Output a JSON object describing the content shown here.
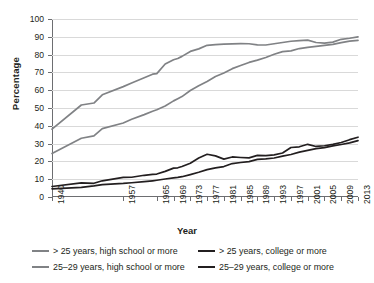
{
  "chart_data": {
    "type": "line",
    "title": "",
    "xlabel": "Year",
    "ylabel": "Percentage",
    "ylim": [
      0,
      100
    ],
    "xlim": [
      1940,
      2013
    ],
    "grid": true,
    "legend_position": "bottom",
    "yticks": [
      0,
      10,
      20,
      30,
      40,
      50,
      60,
      70,
      80,
      90,
      100
    ],
    "xticks": [
      1940,
      1957,
      1965,
      1969,
      1973,
      1977,
      1981,
      1985,
      1989,
      1993,
      1997,
      2001,
      2005,
      2009,
      2013
    ],
    "x": [
      1940,
      1947,
      1950,
      1952,
      1957,
      1959,
      1962,
      1964,
      1965,
      1967,
      1969,
      1970,
      1971,
      1973,
      1975,
      1977,
      1979,
      1981,
      1983,
      1985,
      1987,
      1989,
      1991,
      1993,
      1995,
      1997,
      1999,
      2001,
      2003,
      2005,
      2007,
      2009,
      2011,
      2013
    ],
    "series": [
      {
        "name": "> 25 years, high school or more",
        "color": "#808285",
        "values": [
          24.5,
          33.0,
          34.3,
          38.4,
          41.6,
          43.7,
          46.3,
          48.2,
          49.0,
          51.1,
          54.0,
          55.2,
          56.4,
          59.8,
          62.5,
          64.9,
          67.7,
          69.7,
          72.1,
          73.9,
          75.6,
          76.9,
          78.4,
          80.2,
          81.7,
          82.1,
          83.4,
          84.1,
          84.6,
          85.2,
          85.7,
          86.7,
          87.6,
          88.0
        ]
      },
      {
        "name": "25–29 years, high school or more",
        "color": "#808285",
        "values": [
          38.1,
          51.7,
          52.8,
          57.4,
          62.0,
          64.0,
          67.0,
          69.0,
          69.3,
          74.7,
          77.1,
          77.8,
          79.0,
          81.8,
          83.2,
          85.2,
          85.6,
          85.9,
          86.0,
          86.2,
          86.1,
          85.5,
          85.4,
          86.1,
          86.8,
          87.5,
          87.8,
          88.1,
          86.8,
          86.4,
          87.0,
          88.6,
          89.2,
          90.0
        ]
      },
      {
        "name": "> 25 years, college or more",
        "color": "#231f20",
        "values": [
          4.6,
          5.4,
          6.2,
          7.0,
          7.6,
          8.0,
          8.6,
          9.1,
          9.4,
          10.1,
          10.7,
          11.0,
          11.4,
          12.6,
          13.9,
          15.4,
          16.4,
          17.1,
          18.8,
          19.4,
          19.9,
          21.1,
          21.4,
          21.9,
          23.0,
          23.9,
          25.2,
          26.2,
          27.2,
          27.7,
          28.7,
          29.5,
          30.4,
          31.7
        ]
      },
      {
        "name": "25–29 years, college or more",
        "color": "#231f20",
        "values": [
          5.9,
          7.9,
          7.7,
          9.1,
          11.0,
          11.1,
          12.2,
          12.7,
          12.9,
          14.4,
          16.2,
          16.4,
          17.1,
          19.0,
          21.9,
          24.0,
          23.1,
          21.3,
          22.5,
          22.2,
          22.0,
          23.4,
          23.2,
          23.7,
          24.7,
          27.8,
          28.2,
          29.6,
          28.4,
          28.8,
          29.6,
          30.6,
          32.2,
          33.6
        ]
      }
    ],
    "legend_entries": [
      {
        "label": "> 25 years, high school or more",
        "color": "#808285"
      },
      {
        "label": "> 25 years, college or more",
        "color": "#231f20"
      },
      {
        "label": "25–29 years, high school or more",
        "color": "#808285"
      },
      {
        "label": "25–29 years, college or more",
        "color": "#231f20"
      }
    ]
  }
}
